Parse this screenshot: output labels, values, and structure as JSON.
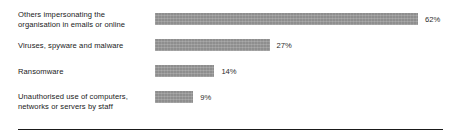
{
  "chart_data": {
    "type": "bar",
    "orientation": "horizontal",
    "title": "",
    "subtitle": "",
    "xlabel": "",
    "ylabel": "",
    "xlim": [
      0,
      70
    ],
    "grid": false,
    "legend": null,
    "value_suffix": "%",
    "bar_color": "#8e8e8e",
    "categories": [
      "Others impersonating the organisation in emails or online",
      "Viruses, spyware and malware",
      "Ransomware",
      "Unauthorised use of computers, networks or servers by staff"
    ],
    "values": [
      62,
      27,
      14,
      9
    ],
    "data_labels": [
      "62%",
      "27%",
      "14%",
      "9%"
    ]
  },
  "rows": [
    {
      "label_line1": "Others impersonating the",
      "label_line2": "organisation in emails or online",
      "value_label": "62%",
      "value": 62
    },
    {
      "label_line1": "Viruses, spyware and malware",
      "label_line2": "",
      "value_label": "27%",
      "value": 27
    },
    {
      "label_line1": "Ransomware",
      "label_line2": "",
      "value_label": "14%",
      "value": 14
    },
    {
      "label_line1": "Unauthorised use of computers,",
      "label_line2": "networks or servers by staff",
      "value_label": "9%",
      "value": 9
    }
  ]
}
